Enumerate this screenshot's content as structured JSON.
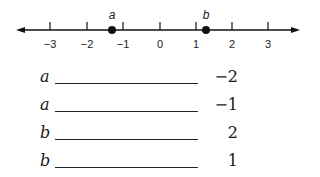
{
  "number_line": {
    "ticks": [
      {
        "label": "−3",
        "x": 50
      },
      {
        "label": "−2",
        "x": 87
      },
      {
        "label": "−1",
        "x": 123
      },
      {
        "label": "0",
        "x": 160
      },
      {
        "label": "1",
        "x": 196
      },
      {
        "label": "2",
        "x": 232
      },
      {
        "label": "3",
        "x": 268
      }
    ],
    "points": [
      {
        "label": "a",
        "x": 112
      },
      {
        "label": "b",
        "x": 206
      }
    ]
  },
  "matching": {
    "rows": [
      {
        "variable": "a",
        "value": "−2"
      },
      {
        "variable": "a",
        "value": "−1"
      },
      {
        "variable": "b",
        "value": "2"
      },
      {
        "variable": "b",
        "value": "1"
      }
    ]
  }
}
